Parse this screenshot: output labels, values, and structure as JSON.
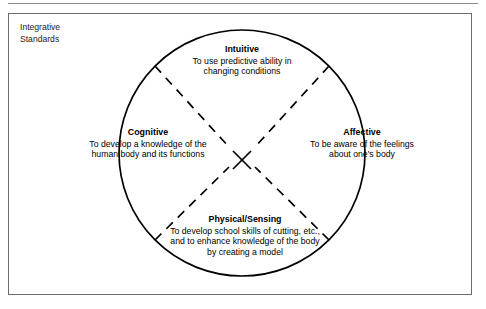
{
  "figure": {
    "caption": "Integrative\nStandards",
    "shape": "circle",
    "colors": {
      "stroke": "#000000",
      "frame": "#6b6b6b",
      "rule": "#8a8a8a",
      "text": "#000000",
      "background": "#ffffff"
    }
  },
  "quadrants": [
    {
      "id": "intuitive",
      "title": "Intuitive",
      "body": "To use predictive ability in\nchanging conditions"
    },
    {
      "id": "cognitive",
      "title": "Cognitive",
      "body": "To develop a knowledge of the\nhuman body and its functions"
    },
    {
      "id": "affective",
      "title": "Affective",
      "body": "To be aware of the feelings\nabout one's body"
    },
    {
      "id": "physical",
      "title": "Physical/Sensing",
      "body": "To develop school skills of cutting, etc.,\nand to enhance knowledge of the body\nby creating a model"
    }
  ]
}
